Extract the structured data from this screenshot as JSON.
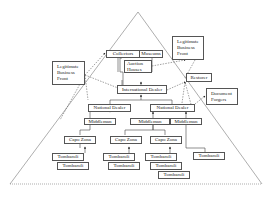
{
  "diagram": {
    "type": "hierarchy-pyramid",
    "nodes": {
      "collectors": "Collectors",
      "museums": "Museums",
      "auction_houses": "Auction Houses",
      "legit_front_left": "Legitimate Business Front",
      "legit_front_right": "Legitimate Business Front",
      "restorer": "Restorer",
      "document_forgers": "Document Forgers",
      "international_dealer": "International Dealer",
      "national_dealer_1": "National Dealer",
      "national_dealer_2": "National Dealer",
      "middleman_1": "Middleman",
      "middleman_2": "Middleman",
      "middleman_3": "Middleman",
      "capo_zona_1": "Capo Zona",
      "capo_zona_2": "Capo Zona",
      "capo_zona_3": "Capo Zona",
      "tombaroli": [
        "Tombaroli",
        "Tombaroli",
        "Tombaroli",
        "Tombaroli",
        "Tombaroli",
        "Tombaroli",
        "Tombaroli",
        "Tombaroli"
      ]
    },
    "colors": {
      "line": "#555555",
      "dashed": "#444444",
      "background": "#ffffff"
    }
  }
}
